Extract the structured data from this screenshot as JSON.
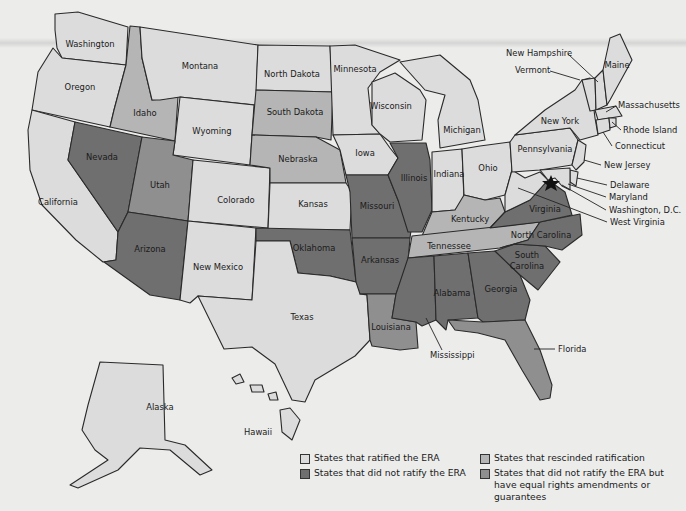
{
  "legend": {
    "items": [
      {
        "label": "States that ratified the ERA",
        "color": "#dcdcdc"
      },
      {
        "label": "States that did not ratify the ERA",
        "color": "#6f6f6f"
      },
      {
        "label": "States that rescinded ratification",
        "color": "#b5b5b5"
      },
      {
        "label": "States that did not ratify the ERA but",
        "label2": "have equal rights amendments or guarantees",
        "color": "#8f8f8f"
      }
    ]
  },
  "states": {
    "washington": "Washington",
    "oregon": "Oregon",
    "california": "California",
    "idaho": "Idaho",
    "nevada": "Nevada",
    "montana": "Montana",
    "wyoming": "Wyoming",
    "utah": "Utah",
    "arizona": "Arizona",
    "colorado": "Colorado",
    "new_mexico": "New Mexico",
    "north_dakota": "North Dakota",
    "south_dakota": "South Dakota",
    "nebraska": "Nebraska",
    "kansas": "Kansas",
    "oklahoma": "Oklahoma",
    "texas": "Texas",
    "minnesota": "Minnesota",
    "iowa": "Iowa",
    "missouri": "Missouri",
    "arkansas": "Arkansas",
    "louisiana": "Louisiana",
    "wisconsin": "Wisconsin",
    "illinois": "Illinois",
    "michigan": "Michigan",
    "indiana": "Indiana",
    "ohio": "Ohio",
    "kentucky": "Kentucky",
    "tennessee": "Tennessee",
    "mississippi": "Mississippi",
    "alabama": "Alabama",
    "georgia": "Georgia",
    "florida": "Florida",
    "south_carolina_1": "South",
    "south_carolina_2": "Carolina",
    "north_carolina": "North Carolina",
    "virginia": "Virginia",
    "west_virginia": "West Virginia",
    "pennsylvania": "Pennsylvania",
    "new_york": "New York",
    "new_jersey": "New Jersey",
    "delaware": "Delaware",
    "maryland": "Maryland",
    "washington_dc": "Washington, D.C.",
    "connecticut": "Connecticut",
    "rhode_island": "Rhode Island",
    "massachusetts": "Massachusetts",
    "vermont": "Vermont",
    "new_hampshire": "New Hampshire",
    "maine": "Maine",
    "alaska": "Alaska",
    "hawaii": "Hawaii"
  },
  "categories": {
    "ratified": [
      "Washington",
      "Oregon",
      "California",
      "Montana",
      "Wyoming",
      "Colorado",
      "New Mexico",
      "North Dakota",
      "Kansas",
      "Texas",
      "Minnesota",
      "Iowa",
      "Wisconsin",
      "Michigan",
      "Indiana",
      "Ohio",
      "Pennsylvania",
      "New York",
      "New Jersey",
      "Delaware",
      "Maryland",
      "Connecticut",
      "Rhode Island",
      "Massachusetts",
      "Vermont",
      "New Hampshire",
      "Maine",
      "West Virginia",
      "Alaska",
      "Hawaii"
    ],
    "not_ratified": [
      "Nevada",
      "Arizona",
      "Oklahoma",
      "Missouri",
      "Arkansas",
      "Illinois",
      "Mississippi",
      "Alabama",
      "Georgia",
      "South Carolina",
      "North Carolina",
      "Virginia"
    ],
    "rescinded": [
      "Idaho",
      "South Dakota",
      "Nebraska",
      "Kentucky",
      "Tennessee"
    ],
    "not_ratified_equal_rights": [
      "Utah",
      "Louisiana",
      "Florida"
    ]
  },
  "markers": {
    "capital_star": "Washington, D.C."
  }
}
